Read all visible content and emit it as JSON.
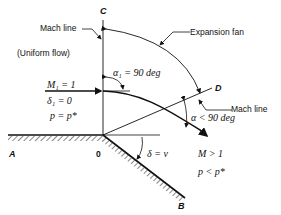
{
  "diagram": {
    "points": {
      "A": "A",
      "O": "0",
      "B": "B",
      "C": "C",
      "D": "D"
    },
    "labels": {
      "mach_line_upper": "Mach line",
      "mach_line_lower": "Mach line",
      "expansion_fan": "Expansion fan",
      "uniform_flow": "(Uniform flow)",
      "upstream_mach": "M₁ = 1",
      "upstream_delta": "δ₁ = 0",
      "upstream_pressure": "p = p*",
      "alpha1": "α₁ = 90 deg",
      "alpha": "α < 90 deg",
      "delta_nu": "δ = ν",
      "downstream_mach": "M > 1",
      "downstream_pressure": "p < p*"
    },
    "colors": {
      "ink": "#111111",
      "background": "#ffffff"
    }
  }
}
